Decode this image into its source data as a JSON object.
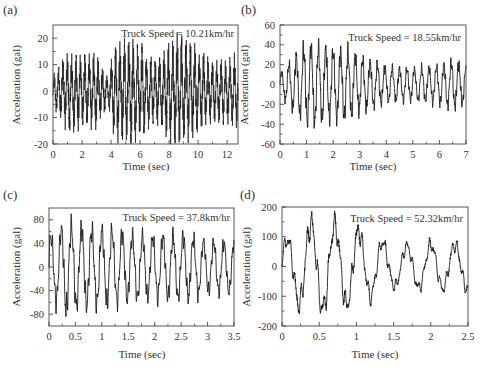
{
  "figure": {
    "panels": [
      {
        "id": "a",
        "label": "(a)",
        "annotation": "Truck Speed = 10.21km/hr"
      },
      {
        "id": "b",
        "label": "(b)",
        "annotation": "Truck Speed = 18.55km/hr"
      },
      {
        "id": "c",
        "label": "(c)",
        "annotation": "Truck Speed = 37.8km/hr"
      },
      {
        "id": "d",
        "label": "(d)",
        "annotation": "Truck Speed = 52.32km/hr"
      }
    ]
  },
  "chart_data": [
    {
      "type": "line",
      "panel": "(a)",
      "title": "",
      "annotation": "Truck Speed = 10.21km/hr",
      "xlabel": "Time (sec)",
      "ylabel": "Acceleration (gal)",
      "xlim": [
        0,
        12.75
      ],
      "ylim": [
        -20,
        25
      ],
      "xticks": [
        0,
        2,
        4,
        6,
        8,
        10,
        12
      ],
      "yticks": [
        -20,
        -10,
        0,
        10,
        20
      ],
      "grid": false,
      "series": [
        {
          "name": "acceleration",
          "description": "dense oscillation ~3.3 Hz with beating envelope; peaks up to ~+19, troughs to ~-20 gal",
          "approx_amplitude_envelope": [
            [
              0,
              5
            ],
            [
              1,
              13
            ],
            [
              3,
              12
            ],
            [
              3.8,
              5
            ],
            [
              4.2,
              16
            ],
            [
              5.6,
              18
            ],
            [
              7,
              10
            ],
            [
              8.6,
              19
            ],
            [
              9.5,
              16
            ],
            [
              11,
              10
            ],
            [
              12.7,
              12
            ]
          ],
          "dominant_freq_hz": 3.3
        }
      ],
      "frame": {
        "x0": 53,
        "x1": 238,
        "y0": 25,
        "y1": 144
      }
    },
    {
      "type": "line",
      "panel": "(b)",
      "title": "",
      "annotation": "Truck Speed = 18.55km/hr",
      "xlabel": "Time (sec)",
      "ylabel": "Acceleration (gal)",
      "xlim": [
        0,
        7
      ],
      "ylim": [
        -60,
        60
      ],
      "xticks": [
        0,
        1,
        2,
        3,
        4,
        5,
        6,
        7
      ],
      "yticks": [
        -60,
        -40,
        -20,
        0,
        20,
        40,
        60
      ],
      "grid": false,
      "series": [
        {
          "name": "acceleration",
          "description": "oscillation ~3.6 Hz; peaks ~+47 near 1 s, decaying to ~+/-20 after 4 s",
          "approx_amplitude_envelope": [
            [
              0,
              12
            ],
            [
              0.5,
              30
            ],
            [
              1,
              45
            ],
            [
              1.3,
              45
            ],
            [
              2,
              40
            ],
            [
              2.5,
              40
            ],
            [
              3,
              32
            ],
            [
              4,
              20
            ],
            [
              5,
              18
            ],
            [
              6,
              22
            ],
            [
              6.5,
              28
            ],
            [
              7,
              22
            ]
          ],
          "dominant_freq_hz": 3.6
        }
      ],
      "frame": {
        "x0": 280,
        "x1": 466,
        "y0": 25,
        "y1": 144
      }
    },
    {
      "type": "line",
      "panel": "(c)",
      "title": "",
      "annotation": "Truck Speed = 37.8km/hr",
      "xlabel": "Time (sec)",
      "ylabel": "Acceleration (gal)",
      "xlim": [
        0,
        3.5
      ],
      "ylim": [
        -100,
        100
      ],
      "xticks": [
        0,
        0.5,
        1,
        1.5,
        2,
        2.5,
        3,
        3.5
      ],
      "yticks": [
        -80,
        -40,
        0,
        40,
        80
      ],
      "tick_labels_x": [
        "0",
        "0.5",
        "1",
        "1.5",
        "2",
        "2.5",
        "3",
        "3.5"
      ],
      "grid": false,
      "series": [
        {
          "name": "acceleration",
          "description": "oscillation ~5.2 Hz with high-frequency ripple; peak ~+88 at 0.35 s, trough ~-85 at 0.15 s, later ~+/-55",
          "approx_amplitude_envelope": [
            [
              0,
              60
            ],
            [
              0.3,
              88
            ],
            [
              0.5,
              80
            ],
            [
              1,
              75
            ],
            [
              1.5,
              65
            ],
            [
              2,
              60
            ],
            [
              2.5,
              65
            ],
            [
              3,
              50
            ],
            [
              3.5,
              50
            ]
          ],
          "dominant_freq_hz": 5.2
        }
      ],
      "frame": {
        "x0": 49,
        "x1": 234,
        "y0": 208,
        "y1": 326
      }
    },
    {
      "type": "line",
      "panel": "(d)",
      "title": "",
      "annotation": "Truck Speed = 52.32km/hr",
      "xlabel": "Time (sec)",
      "ylabel": "Acceleration (gal)",
      "xlim": [
        0,
        2.5
      ],
      "ylim": [
        -200,
        200
      ],
      "xticks": [
        0,
        0.5,
        1,
        1.5,
        2,
        2.5
      ],
      "yticks": [
        -200,
        -100,
        0,
        100,
        200
      ],
      "grid": false,
      "series": [
        {
          "name": "acceleration",
          "description": "oscillation ~3.1 Hz with ripple; peaks ~+175 at 0.28 and 0.6 s, trough ~-170 at 0.45 and 1.0 s, later ~+/-100",
          "approx_amplitude_envelope": [
            [
              0,
              90
            ],
            [
              0.3,
              175
            ],
            [
              0.6,
              175
            ],
            [
              1,
              150
            ],
            [
              1.2,
              120
            ],
            [
              1.5,
              80
            ],
            [
              2,
              90
            ],
            [
              2.5,
              90
            ]
          ],
          "dominant_freq_hz": 3.1
        }
      ],
      "frame": {
        "x0": 282,
        "x1": 468,
        "y0": 207,
        "y1": 326
      }
    }
  ],
  "style": {
    "line_color": "#1a1a1a",
    "frame_color": "#444444",
    "text_color": "#333333"
  }
}
